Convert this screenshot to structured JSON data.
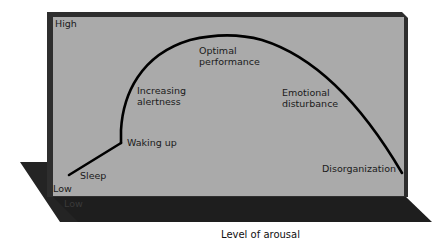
{
  "diagram": {
    "y_axis": {
      "high_label": "High",
      "low_label": "Low"
    },
    "x_axis": {
      "title": "Level of arousal",
      "low_label": "Low"
    },
    "curve_labels": {
      "sleep": "Sleep",
      "waking_up": "Waking up",
      "increasing_alertness_1": "Increasing",
      "increasing_alertness_2": "alertness",
      "optimal_performance_1": "Optimal",
      "optimal_performance_2": "performance",
      "emotional_disturbance_1": "Emotional",
      "emotional_disturbance_2": "disturbance",
      "disorganization": "Disorganization"
    },
    "colors": {
      "panel": "#a9a9a9",
      "frame": "#2b2b2b",
      "floor": "#1f1f1f",
      "curve": "#000000",
      "background": "#ffffff"
    }
  }
}
